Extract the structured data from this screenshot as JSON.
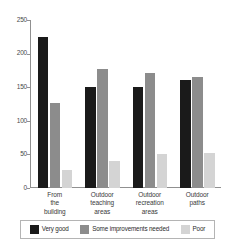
{
  "chart_data": {
    "type": "bar",
    "title": "",
    "subtitle": "",
    "xlabel": "",
    "ylabel": "",
    "ylim": [
      0,
      250
    ],
    "yticks": [
      0,
      50,
      100,
      150,
      200,
      250
    ],
    "grid": false,
    "legend_position": "bottom",
    "categories": [
      "From the building",
      "Outdoor teaching areas",
      "Outdoor recreation areas",
      "Outdoor paths"
    ],
    "category_lines": [
      [
        "From",
        "the",
        "building"
      ],
      [
        "Outdoor",
        "teaching",
        "areas"
      ],
      [
        "Outdoor",
        "recreation",
        "areas"
      ],
      [
        "Outdoor",
        "paths"
      ]
    ],
    "series": [
      {
        "name": "Very good",
        "color": "#1a1a1a",
        "values": [
          225,
          150,
          150,
          160
        ]
      },
      {
        "name": "Some improvements needed",
        "color": "#8c8c8c",
        "values": [
          126,
          177,
          171,
          165
        ]
      },
      {
        "name": "Poor",
        "color": "#d4d4d4",
        "values": [
          27,
          40,
          50,
          52
        ]
      }
    ]
  },
  "axis": {
    "tick_labels": [
      "250",
      "200",
      "150",
      "100",
      "50",
      "0"
    ]
  },
  "legend": {
    "items": [
      {
        "label": "Very good",
        "swatch": "#1a1a1a"
      },
      {
        "label": "Some improvements needed",
        "swatch": "#8c8c8c"
      },
      {
        "label": "Poor",
        "swatch": "#d4d4d4"
      }
    ]
  },
  "colors": {
    "axis": "#909090",
    "legend_border": "#b4b4b4",
    "background": "#ffffff",
    "text": "#2b2b2b"
  }
}
